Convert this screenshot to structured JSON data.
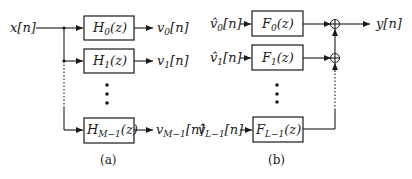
{
  "diagram_a": {
    "input_label": "x[n]",
    "filters": [
      {
        "base": "H",
        "sub": "0",
        "arg": "(z)",
        "out_base": "v",
        "out_sub": "0",
        "out_arg": "[n]"
      },
      {
        "base": "H",
        "sub": "1",
        "arg": "(z)",
        "out_base": "v",
        "out_sub": "1",
        "out_arg": "[n]"
      },
      {
        "base": "H",
        "sub": "M−1",
        "arg": "(z)",
        "out_base": "v",
        "out_sub": "M−1",
        "out_arg": "[n]"
      }
    ],
    "caption": "(a)"
  },
  "diagram_b": {
    "filters": [
      {
        "in_base": "v̂",
        "in_sub": "0",
        "in_arg": "[n]",
        "base": "F",
        "sub": "0",
        "arg": "(z)"
      },
      {
        "in_base": "v̂",
        "in_sub": "1",
        "in_arg": "[n]",
        "base": "F",
        "sub": "1",
        "arg": "(z)"
      },
      {
        "in_base": "v̂",
        "in_sub": "L−1",
        "in_arg": "[n]",
        "base": "F",
        "sub": "L−1",
        "arg": "(z)"
      }
    ],
    "output_label": "y[n]",
    "adder_symbol": "+",
    "caption": "(b)"
  }
}
